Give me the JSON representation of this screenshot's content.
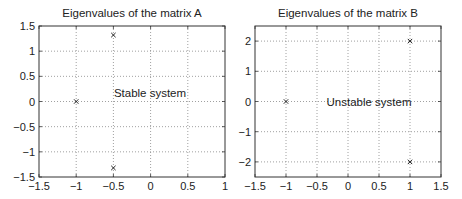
{
  "chart_data": [
    {
      "type": "scatter",
      "title": "Eigenvalues of the matrix A",
      "xlabel": "",
      "ylabel": "",
      "xlim": [
        -1.5,
        1
      ],
      "ylim": [
        -1.5,
        1.5
      ],
      "xticks": [
        "-1.5",
        "-1",
        "-0.5",
        "0",
        "0.5",
        "1"
      ],
      "yticks": [
        "1.5",
        "1",
        "0.5",
        "0",
        "-0.5",
        "-1",
        "-1.5"
      ],
      "grid": true,
      "marker": "x",
      "annotation": "Stable system",
      "points": [
        {
          "x": -0.5,
          "y": 1.32
        },
        {
          "x": -1,
          "y": 0
        },
        {
          "x": -0.5,
          "y": -1.32
        }
      ]
    },
    {
      "type": "scatter",
      "title": "Eigenvalues of the matrix B",
      "xlabel": "",
      "ylabel": "",
      "xlim": [
        -1.5,
        1.5
      ],
      "ylim": [
        -2.5,
        2.5
      ],
      "xticks": [
        "-1.5",
        "-1",
        "-0.5",
        "0",
        "0.5",
        "1",
        "1.5"
      ],
      "yticks": [
        "2",
        "1",
        "0",
        "-1",
        "-2"
      ],
      "grid": true,
      "marker": "x",
      "annotation": "Unstable system",
      "points": [
        {
          "x": 1,
          "y": 2
        },
        {
          "x": -1,
          "y": 0
        },
        {
          "x": 1,
          "y": -2
        }
      ]
    }
  ]
}
